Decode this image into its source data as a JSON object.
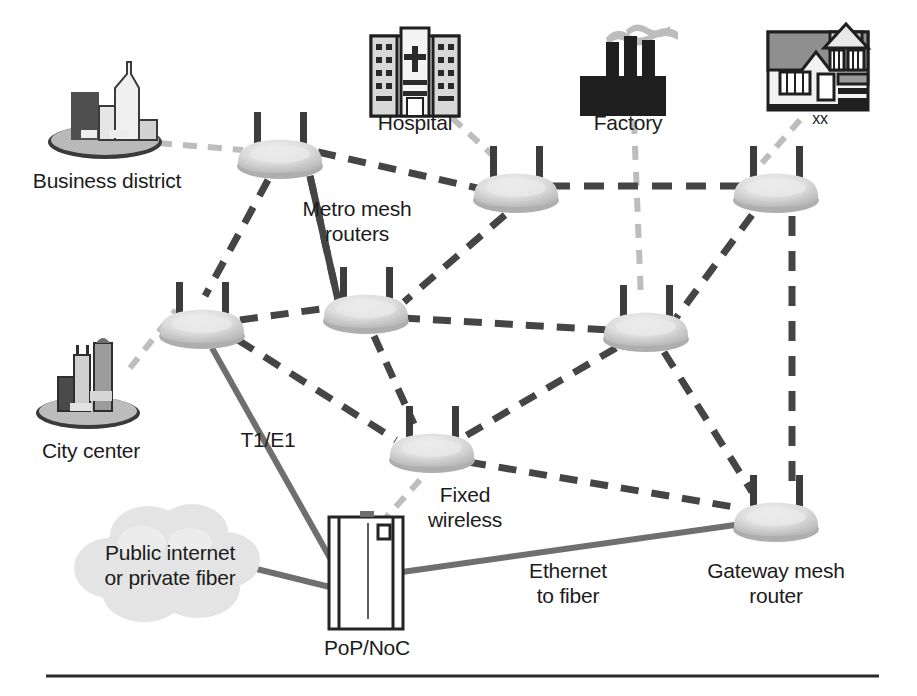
{
  "diagram": {
    "background": "#ffffff",
    "colors": {
      "wireless_link": "#4a4a4a",
      "wired_link": "#707070",
      "faint_link": "#bdbdbd",
      "router_body": "#d9d9d9",
      "router_shadow": "#a8a8a8",
      "antenna": "#3c3c3c",
      "cloud": "#e2e2e2",
      "text": "#1c1c1c",
      "rule": "#2b2b2b"
    },
    "labels": {
      "business_district": "Business district",
      "metro_mesh_routers": "Metro mesh\nrouters",
      "hospital": "Hospital",
      "factory": "Factory",
      "house_tag": "xx",
      "city_center": "City center",
      "t1e1": "T1/E1",
      "fixed_wireless": "Fixed\nwireless",
      "public_internet": "Public internet\nor private fiber",
      "pop_noc": "PoP/NoC",
      "ethernet_to_fiber": "Ethernet\nto fiber",
      "gateway_mesh_router": "Gateway mesh\nrouter"
    },
    "icons": {
      "business_district": "city-skyline-icon",
      "city_center": "city-skyline-icon",
      "hospital": "hospital-building-icon",
      "factory": "factory-icon",
      "house": "house-icon",
      "cloud": "cloud-icon",
      "pop_noc": "server-rack-icon",
      "router": "wireless-router-icon"
    },
    "nodes": [
      {
        "id": "r1",
        "name": "metro-mesh-router-1",
        "x": 280,
        "y": 158,
        "kind": "router"
      },
      {
        "id": "r2",
        "name": "metro-mesh-router-2",
        "x": 516,
        "y": 192,
        "kind": "router"
      },
      {
        "id": "r3",
        "name": "metro-mesh-router-3",
        "x": 776,
        "y": 192,
        "kind": "router"
      },
      {
        "id": "r4",
        "name": "metro-mesh-router-4",
        "x": 202,
        "y": 328,
        "kind": "router"
      },
      {
        "id": "r5",
        "name": "metro-mesh-router-5",
        "x": 366,
        "y": 313,
        "kind": "router"
      },
      {
        "id": "r6",
        "name": "metro-mesh-router-6",
        "x": 646,
        "y": 331,
        "kind": "router"
      },
      {
        "id": "r7",
        "name": "fixed-wireless-router",
        "x": 432,
        "y": 452,
        "kind": "router"
      },
      {
        "id": "r8",
        "name": "gateway-mesh-router",
        "x": 776,
        "y": 521,
        "kind": "router"
      },
      {
        "id": "business",
        "name": "business-district-site",
        "x": 105,
        "y": 120,
        "kind": "site"
      },
      {
        "id": "hospital",
        "name": "hospital-site",
        "x": 415,
        "y": 75,
        "kind": "site"
      },
      {
        "id": "factory",
        "name": "factory-site",
        "x": 628,
        "y": 75,
        "kind": "site"
      },
      {
        "id": "house",
        "name": "residence-site",
        "x": 818,
        "y": 72,
        "kind": "site"
      },
      {
        "id": "city",
        "name": "city-center-site",
        "x": 88,
        "y": 385,
        "kind": "site"
      },
      {
        "id": "cloud",
        "name": "public-internet-cloud",
        "x": 168,
        "y": 560,
        "kind": "cloud"
      },
      {
        "id": "pop",
        "name": "pop-noc-rack",
        "x": 366,
        "y": 575,
        "kind": "rack"
      }
    ],
    "links": [
      {
        "from": "business",
        "to": "r1",
        "type": "faint-wireless"
      },
      {
        "from": "hospital",
        "to": "r2",
        "type": "faint-wireless"
      },
      {
        "from": "factory",
        "to": "r6",
        "type": "faint-wireless"
      },
      {
        "from": "house",
        "to": "r3",
        "type": "faint-wireless"
      },
      {
        "from": "city",
        "to": "r4",
        "type": "faint-wireless"
      },
      {
        "from": "r7",
        "to": "pop",
        "type": "faint-wireless"
      },
      {
        "from": "r1",
        "to": "r2",
        "type": "wireless"
      },
      {
        "from": "r1",
        "to": "r4",
        "type": "wireless"
      },
      {
        "from": "r1",
        "to": "r5",
        "type": "wireless"
      },
      {
        "from": "r2",
        "to": "r3",
        "type": "wireless"
      },
      {
        "from": "r2",
        "to": "r5",
        "type": "wireless"
      },
      {
        "from": "r3",
        "to": "r6",
        "type": "wireless"
      },
      {
        "from": "r3",
        "to": "r8",
        "type": "wireless"
      },
      {
        "from": "r4",
        "to": "r5",
        "type": "wireless"
      },
      {
        "from": "r4",
        "to": "r7",
        "type": "wireless"
      },
      {
        "from": "r5",
        "to": "r6",
        "type": "wireless"
      },
      {
        "from": "r5",
        "to": "r7",
        "type": "wireless"
      },
      {
        "from": "r6",
        "to": "r7",
        "type": "wireless"
      },
      {
        "from": "r6",
        "to": "r8",
        "type": "wireless"
      },
      {
        "from": "r7",
        "to": "r8",
        "type": "wireless"
      },
      {
        "from": "r4",
        "to": "pop",
        "type": "wired",
        "label": "T1/E1"
      },
      {
        "from": "cloud",
        "to": "pop",
        "type": "wired"
      },
      {
        "from": "pop",
        "to": "r8",
        "type": "wired",
        "label": "Ethernet to fiber"
      }
    ],
    "footer_rule": {
      "x1": 46,
      "x2": 879,
      "y": 676
    }
  }
}
